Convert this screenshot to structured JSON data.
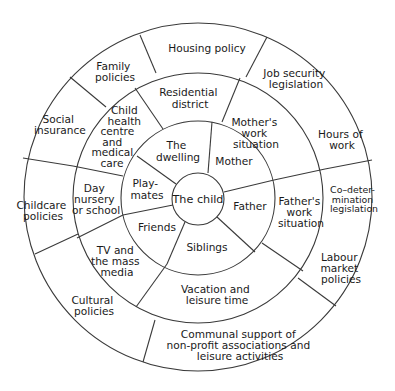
{
  "diagram": {
    "center": {
      "label": "The child"
    },
    "rings": [
      {
        "level": 1,
        "name": "Immediate environment",
        "segments": [
          {
            "id": "dwelling",
            "lines": [
              "The",
              "dwelling"
            ]
          },
          {
            "id": "mother",
            "lines": [
              "Mother"
            ]
          },
          {
            "id": "father",
            "lines": [
              "Father"
            ]
          },
          {
            "id": "siblings",
            "lines": [
              "Siblings"
            ]
          },
          {
            "id": "friends",
            "lines": [
              "Friends"
            ]
          },
          {
            "id": "playmates",
            "lines": [
              "Play-",
              "mates"
            ]
          }
        ]
      },
      {
        "level": 2,
        "name": "Local context",
        "segments": [
          {
            "id": "residential-district",
            "lines": [
              "Residential",
              "district"
            ]
          },
          {
            "id": "mothers-work",
            "lines": [
              "Mother's",
              "work",
              "situation"
            ]
          },
          {
            "id": "fathers-work",
            "lines": [
              "Father's",
              "work",
              "situation"
            ]
          },
          {
            "id": "vacation-leisure",
            "lines": [
              "Vacation and",
              "leisure time"
            ]
          },
          {
            "id": "tv-media",
            "lines": [
              "TV and",
              "the mass",
              "media"
            ]
          },
          {
            "id": "day-nursery",
            "lines": [
              "Day",
              "nursery",
              "or school"
            ]
          },
          {
            "id": "child-health",
            "lines": [
              "Child",
              "health",
              "centre",
              "and",
              "medical",
              "care"
            ]
          }
        ]
      },
      {
        "level": 3,
        "name": "Policy context",
        "segments": [
          {
            "id": "housing-policy",
            "lines": [
              "Housing policy"
            ]
          },
          {
            "id": "job-security",
            "lines": [
              "Job security",
              "legislation"
            ]
          },
          {
            "id": "hours-of-work",
            "lines": [
              "Hours of",
              "work"
            ]
          },
          {
            "id": "codetermination",
            "lines": [
              "Co–deter-",
              "mination",
              "legislation"
            ]
          },
          {
            "id": "labour-market",
            "lines": [
              "Labour",
              "market",
              "policies"
            ]
          },
          {
            "id": "communal-support",
            "lines": [
              "Communal support of",
              "non-profit associations and",
              "leisure activities"
            ]
          },
          {
            "id": "cultural-policies",
            "lines": [
              "Cultural",
              "policies"
            ]
          },
          {
            "id": "childcare-policies",
            "lines": [
              "Childcare",
              "policies"
            ]
          },
          {
            "id": "social-insurance",
            "lines": [
              "Social",
              "insurance"
            ]
          },
          {
            "id": "family-policies",
            "lines": [
              "Family",
              "policies"
            ]
          }
        ]
      }
    ],
    "colors": {
      "stroke": "#3a3a3a",
      "text": "#1a1a1a",
      "background": "#ffffff"
    }
  }
}
